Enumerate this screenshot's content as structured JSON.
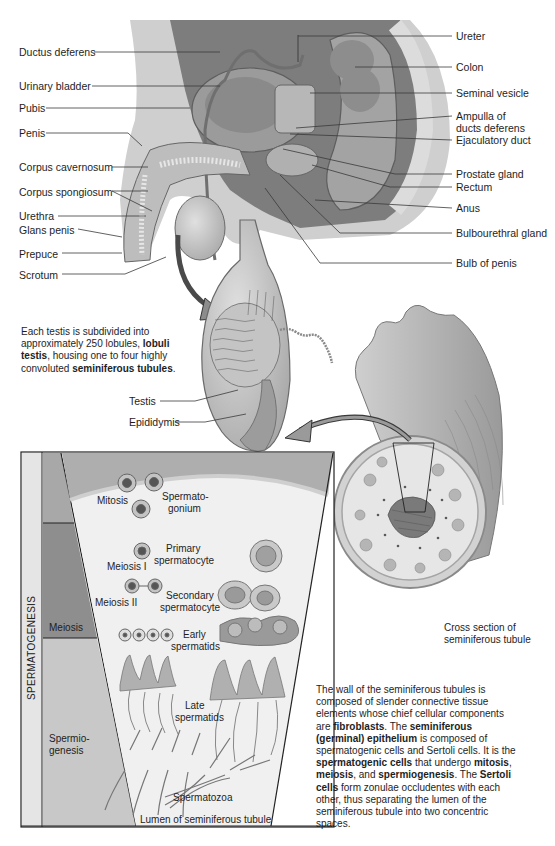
{
  "anatomy_labels": {
    "left": [
      {
        "text": "Ductus deferens",
        "y": 52
      },
      {
        "text": "Urinary bladder",
        "y": 85
      },
      {
        "text": "Pubis",
        "y": 107
      },
      {
        "text": "Penis",
        "y": 133
      },
      {
        "text": "Corpus cavernosum",
        "y": 167
      },
      {
        "text": "Corpus spongiosum",
        "y": 191
      },
      {
        "text": "Urethra",
        "y": 216
      },
      {
        "text": "Glans penis",
        "y": 229
      },
      {
        "text": "Prepuce",
        "y": 253
      },
      {
        "text": "Scrotum",
        "y": 274
      }
    ],
    "right": [
      {
        "text": "Ureter",
        "y": 36
      },
      {
        "text": "Colon",
        "y": 67
      },
      {
        "text": "Seminal vesicle",
        "y": 93
      },
      {
        "text": "Ampulla of",
        "y": 116
      },
      {
        "text": "ducts deferens",
        "y": 128
      },
      {
        "text": "Ejaculatory duct",
        "y": 140
      },
      {
        "text": "Prostate gland",
        "y": 174
      },
      {
        "text": "Rectum",
        "y": 187
      },
      {
        "text": "Anus",
        "y": 208
      },
      {
        "text": "Bulbourethral gland",
        "y": 233
      },
      {
        "text": "Bulb of penis",
        "y": 263
      }
    ]
  },
  "testis_note": {
    "parts": [
      {
        "t": "Each testis is subdivided into approximately 250 lobules, ",
        "b": false
      },
      {
        "t": "lobuli testis",
        "b": true
      },
      {
        "t": ", housing one to four highly convoluted ",
        "b": false
      },
      {
        "t": "seminiferous tubules",
        "b": true
      },
      {
        "t": ".",
        "b": false
      }
    ]
  },
  "testis_labels": {
    "testis": "Testis",
    "epididymis": "Epididymis"
  },
  "panel": {
    "vertical_title": "SPERMATOGENESIS",
    "stages": {
      "meiosis": "Meiosis",
      "spermiogenesis_1": "Spermio-",
      "spermiogenesis_2": "genesis"
    },
    "cell_labels": {
      "mitosis": "Mitosis",
      "spermatogonium_1": "Spermato-",
      "spermatogonium_2": "gonium",
      "primary_1": "Primary",
      "primary_2": "spermatocyte",
      "meiosis_1": "Meiosis I",
      "secondary_1": "Secondary",
      "secondary_2": "spermatocyte",
      "meiosis_2": "Meiosis II",
      "early_1": "Early",
      "early_2": "spermatids",
      "late_1": "Late",
      "late_2": "spermatids",
      "spermatozoa": "Spermatozoa",
      "lumen": "Lumen of seminiferous tubule"
    }
  },
  "cross_section": {
    "line1": "Cross section of",
    "line2": "seminiferous tubule"
  },
  "wall_note": {
    "parts": [
      {
        "t": "The wall of the seminiferous tubules is composed of slender connective tissue elements whose chief cellular components are ",
        "b": false
      },
      {
        "t": "fibroblasts",
        "b": true
      },
      {
        "t": ". The ",
        "b": false
      },
      {
        "t": "seminiferous (germinal) epithelium",
        "b": true
      },
      {
        "t": " is composed of spermatogenic cells and Sertoli cells. It is the ",
        "b": false
      },
      {
        "t": "spermatogenic cells",
        "b": true
      },
      {
        "t": " that undergo ",
        "b": false
      },
      {
        "t": "mitosis",
        "b": true
      },
      {
        "t": ", ",
        "b": false
      },
      {
        "t": "meiosis",
        "b": true
      },
      {
        "t": ", and ",
        "b": false
      },
      {
        "t": "spermiogenesis",
        "b": true
      },
      {
        "t": ". The ",
        "b": false
      },
      {
        "t": "Sertoli cells",
        "b": true
      },
      {
        "t": " form zonulae occludentes with each other, thus separating the lumen of the seminiferous tubule into two concentric spaces.",
        "b": false
      }
    ]
  },
  "colors": {
    "tissue_light": "#d9d9d9",
    "tissue_mid": "#b5b5b5",
    "tissue_dark": "#7a7a7a",
    "line": "#333333",
    "panel_bg": "#f2f2f2"
  }
}
